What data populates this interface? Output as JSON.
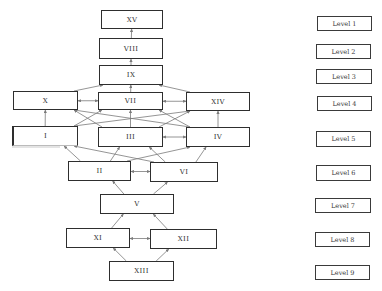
{
  "diagram": {
    "type": "ISM hierarchy",
    "nodes": [
      {
        "id": "XV",
        "label": "XV",
        "level": 1,
        "x": 101,
        "y": 10,
        "w": 62,
        "h": 19
      },
      {
        "id": "VIII",
        "label": "VIII",
        "level": 2,
        "x": 99,
        "y": 38,
        "w": 64,
        "h": 21
      },
      {
        "id": "IX",
        "label": "IX",
        "level": 3,
        "x": 99,
        "y": 65,
        "w": 64,
        "h": 20
      },
      {
        "id": "X",
        "label": "X",
        "level": 4,
        "x": 13,
        "y": 91,
        "w": 65,
        "h": 19
      },
      {
        "id": "VII",
        "label": "VII",
        "level": 4,
        "x": 98,
        "y": 92,
        "w": 65,
        "h": 18
      },
      {
        "id": "XIV",
        "label": "XIV",
        "level": 4,
        "x": 186,
        "y": 92,
        "w": 64,
        "h": 19
      },
      {
        "id": "I",
        "label": "I",
        "level": 5,
        "x": 12,
        "y": 126,
        "w": 66,
        "h": 20
      },
      {
        "id": "III",
        "label": "III",
        "level": 5,
        "x": 98,
        "y": 127,
        "w": 65,
        "h": 20
      },
      {
        "id": "IV",
        "label": "IV",
        "level": 5,
        "x": 186,
        "y": 127,
        "w": 64,
        "h": 20
      },
      {
        "id": "II",
        "label": "II",
        "level": 6,
        "x": 68,
        "y": 161,
        "w": 63,
        "h": 20
      },
      {
        "id": "VI",
        "label": "VI",
        "level": 6,
        "x": 150,
        "y": 162,
        "w": 68,
        "h": 20
      },
      {
        "id": "V",
        "label": "V",
        "level": 7,
        "x": 100,
        "y": 194,
        "w": 74,
        "h": 20
      },
      {
        "id": "XI",
        "label": "XI",
        "level": 8,
        "x": 66,
        "y": 228,
        "w": 64,
        "h": 20
      },
      {
        "id": "XII",
        "label": "XII",
        "level": 8,
        "x": 150,
        "y": 229,
        "w": 67,
        "h": 20
      },
      {
        "id": "XIII",
        "label": "XIII",
        "level": 9,
        "x": 109,
        "y": 261,
        "w": 65,
        "h": 20
      }
    ],
    "levels": [
      {
        "label": "Level 1",
        "x": 317,
        "y": 16,
        "w": 55,
        "h": 15
      },
      {
        "label": "Level 2",
        "x": 316,
        "y": 44,
        "w": 55,
        "h": 15
      },
      {
        "label": "Level 3",
        "x": 316,
        "y": 69,
        "w": 56,
        "h": 15
      },
      {
        "label": "Level 4",
        "x": 317,
        "y": 96,
        "w": 55,
        "h": 15
      },
      {
        "label": "Level 5",
        "x": 316,
        "y": 131,
        "w": 55,
        "h": 16
      },
      {
        "label": "Level 6",
        "x": 316,
        "y": 165,
        "w": 55,
        "h": 16
      },
      {
        "label": "Level 7",
        "x": 315,
        "y": 198,
        "w": 56,
        "h": 15
      },
      {
        "label": "Level 8",
        "x": 315,
        "y": 232,
        "w": 55,
        "h": 15
      },
      {
        "label": "Level 9",
        "x": 315,
        "y": 265,
        "w": 55,
        "h": 15
      }
    ],
    "edges": [
      {
        "from": "VIII",
        "to": "XV",
        "type": "arrow"
      },
      {
        "from": "IX",
        "to": "VIII",
        "type": "arrow"
      },
      {
        "from": "X",
        "to": "IX",
        "type": "arrow"
      },
      {
        "from": "VII",
        "to": "IX",
        "type": "arrow"
      },
      {
        "from": "XIV",
        "to": "IX",
        "type": "arrow"
      },
      {
        "from": "X",
        "to": "VII",
        "type": "bidirectional"
      },
      {
        "from": "VII",
        "to": "XIV",
        "type": "bidirectional"
      },
      {
        "from": "I",
        "to": "X",
        "type": "arrow"
      },
      {
        "from": "I",
        "to": "VII",
        "type": "arrow"
      },
      {
        "from": "I",
        "to": "XIV",
        "type": "arrow"
      },
      {
        "from": "III",
        "to": "X",
        "type": "arrow"
      },
      {
        "from": "III",
        "to": "VII",
        "type": "arrow"
      },
      {
        "from": "III",
        "to": "XIV",
        "type": "arrow"
      },
      {
        "from": "IV",
        "to": "X",
        "type": "arrow"
      },
      {
        "from": "IV",
        "to": "VII",
        "type": "arrow"
      },
      {
        "from": "IV",
        "to": "XIV",
        "type": "arrow"
      },
      {
        "from": "III",
        "to": "IV",
        "type": "bidirectional"
      },
      {
        "from": "II",
        "to": "I",
        "type": "arrow"
      },
      {
        "from": "II",
        "to": "III",
        "type": "arrow"
      },
      {
        "from": "II",
        "to": "IV",
        "type": "arrow"
      },
      {
        "from": "VI",
        "to": "I",
        "type": "arrow"
      },
      {
        "from": "VI",
        "to": "III",
        "type": "arrow"
      },
      {
        "from": "VI",
        "to": "IV",
        "type": "arrow"
      },
      {
        "from": "II",
        "to": "VI",
        "type": "bidirectional"
      },
      {
        "from": "V",
        "to": "II",
        "type": "arrow"
      },
      {
        "from": "V",
        "to": "VI",
        "type": "arrow"
      },
      {
        "from": "XI",
        "to": "V",
        "type": "arrow"
      },
      {
        "from": "XII",
        "to": "V",
        "type": "arrow"
      },
      {
        "from": "XI",
        "to": "XII",
        "type": "bidirectional"
      },
      {
        "from": "XIII",
        "to": "XI",
        "type": "arrow"
      },
      {
        "from": "XIII",
        "to": "XII",
        "type": "arrow"
      }
    ],
    "colors": {
      "box_border": "#2e2e2e",
      "edge": "#7a7a7a",
      "text": "#333333",
      "background": "#ffffff"
    }
  }
}
